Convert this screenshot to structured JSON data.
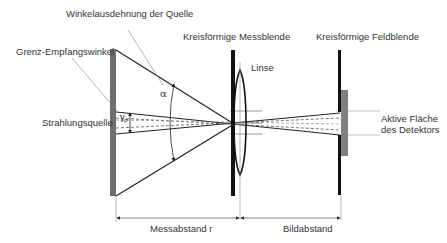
{
  "diagram": {
    "labels": {
      "angular_extent": "Winkelausdehnung der Quelle",
      "acceptance_angle": "Grenz-Empfangswinkel",
      "radiation_source": "Strahlungsquelle",
      "measuring_aperture": "Kreisförmige Messblende",
      "lens": "Linse",
      "field_stop": "Kreisförmige Feldblende",
      "detector_line1": "Aktive Fläche",
      "detector_line2": "des Detektors",
      "measuring_distance": "Messabstand r",
      "image_distance": "Bildabstand",
      "alpha_symbol": "α",
      "gamma_symbol": "γ",
      "gamma_subscript": "P"
    },
    "colors": {
      "source": "#6e6e6e",
      "detector": "#808080",
      "aperture": "#111111",
      "lines": "#222222",
      "leader": "#888888",
      "text": "#333333"
    }
  }
}
